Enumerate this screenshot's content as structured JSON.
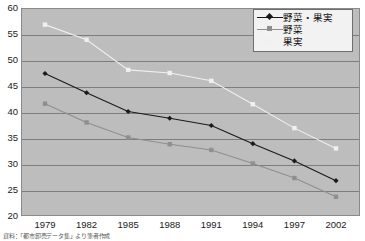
{
  "chart_data": {
    "type": "line",
    "title": "",
    "xlabel": "",
    "ylabel": "",
    "categories": [
      "1979",
      "1982",
      "1985",
      "1988",
      "1991",
      "1994",
      "1997",
      "2002"
    ],
    "ylim": [
      20,
      60
    ],
    "yticks": [
      20,
      25,
      30,
      35,
      40,
      45,
      50,
      55,
      60
    ],
    "grid": true,
    "legend_position": "top-right",
    "series": [
      {
        "name": "野菜・果実",
        "color": "#1a1a1a",
        "marker": "diamond",
        "values": [
          47.4,
          43.7,
          40.1,
          38.8,
          37.4,
          33.9,
          30.6,
          26.8
        ]
      },
      {
        "name": "野菜",
        "color": "#8f8f8f",
        "marker": "square",
        "values": [
          41.6,
          38.0,
          35.1,
          33.8,
          32.7,
          30.1,
          27.3,
          23.7
        ]
      },
      {
        "name": "果実",
        "color": "#f0f0f0",
        "marker": "square",
        "values": [
          56.8,
          53.9,
          48.1,
          47.5,
          46.0,
          41.5,
          36.9,
          33.0
        ]
      }
    ]
  },
  "axis": {
    "y_tick_labels": [
      "60",
      "55",
      "50",
      "45",
      "40",
      "35",
      "30",
      "25",
      "20"
    ],
    "x_tick_labels": [
      "1979",
      "1982",
      "1985",
      "1988",
      "1991",
      "1994",
      "1997",
      "2002"
    ]
  },
  "legend": {
    "entries": [
      {
        "label": "野菜・果実"
      },
      {
        "label": "野菜"
      },
      {
        "label": "果実"
      }
    ]
  },
  "caption": {
    "text": "資料：「都市卸売データ集」より筆者作成"
  },
  "colors": {
    "plot_background": "#bdbdbd",
    "gridline": "#7d7d7d",
    "frame": "#8a8a8a",
    "series_combined": "#1a1a1a",
    "series_vegetables": "#8f8f8f",
    "series_fruits": "#f0f0f0",
    "legend_background": "#f2f2f2",
    "text": "#1a1a1a"
  }
}
